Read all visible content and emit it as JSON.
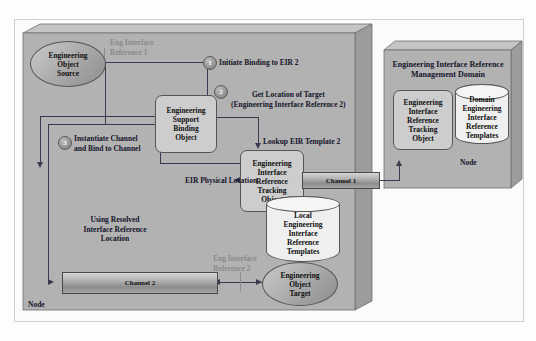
{
  "diagram": {
    "left_node": {
      "node_label": "Node",
      "objects": {
        "source": "Engineering\nObject\nSource",
        "binding": "Engineering\nSupport\nBinding\nObject",
        "tracking": "Engineering\nInterface\nReference\nTracking\nObject",
        "local_templates": "Local\nEngineering\nInterface\nReference\nTemplates",
        "target": "Engineering\nObject\nTarget"
      },
      "channels": {
        "channel2": "Channel 2"
      },
      "labels": {
        "eir1": "Eng Interface\nReference 1",
        "eir2": "Eng Interface\nReference 2",
        "physical_location": "EIR Physical Location",
        "using_resolved": "Using Resolved\nInterface Reference\nLocation"
      },
      "steps": [
        {
          "number": "1",
          "text": "Initiate Binding to EIR 2"
        },
        {
          "number": "2",
          "text": "Get Location of Target\n(Engineering Interface Reference 2)"
        },
        {
          "number": "3",
          "text": "Instantiate Channel\nand Bind to Channel"
        }
      ],
      "lookup_label": "Lookup EIR Template 2"
    },
    "right_node": {
      "title": "Engineering Interface Reference\nManagement Domain",
      "node_label": "Node",
      "objects": {
        "tracking": "Engineering\nInterface\nReference\nTracking\nObject",
        "domain_templates": "Domain\nEngineering\nInterface\nReference\nTemplates"
      },
      "channels": {
        "channel1": "Channel 1"
      }
    },
    "colors": {
      "panel_face": "#b2b2b2",
      "panel_top": "#c3c3c3",
      "panel_side": "#9a9a9a",
      "line": "#3a3a50",
      "text": "#14142a",
      "muted_text": "#8a8a8a",
      "cylinder": "#efefef"
    }
  }
}
